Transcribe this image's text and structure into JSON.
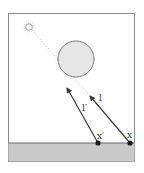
{
  "diagram": {
    "type": "shadow-ray illustration",
    "colors": {
      "background": "#ffffff",
      "frame": "#8a8a8a",
      "ground": "#c9c9c9",
      "ground_edge": "#6a6a6a",
      "occluder_fill": "#e6e6e6",
      "occluder_stroke": "#7a7a7a",
      "light_source": "#bdbdbd",
      "arrow": "#3a3a3a",
      "point": "#1a1a1a",
      "dotted_ray": "#bfbfbf"
    },
    "light_source": {
      "icon": "sun-icon"
    },
    "occluder": {
      "shape": "circle"
    },
    "points": [
      {
        "id": "x_prime",
        "label": "x′"
      },
      {
        "id": "x",
        "label": "x"
      }
    ],
    "rays": [
      {
        "from": "x_prime",
        "label": "l′"
      },
      {
        "from": "x",
        "label": "l"
      }
    ]
  }
}
